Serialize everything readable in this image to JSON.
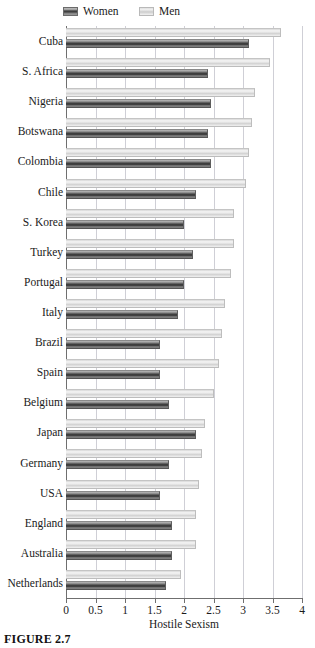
{
  "figure": {
    "caption": "FIGURE 2.7"
  },
  "legend": {
    "position": "top-left",
    "entries": [
      {
        "label": "Women",
        "swatch": "dark-striped-bar-swatch"
      },
      {
        "label": "Men",
        "swatch": "light-bar-swatch"
      }
    ]
  },
  "axis": {
    "x_title": "Hostile Sexism",
    "x_ticks": [
      "0",
      "0.5",
      "1",
      "1.5",
      "2",
      "2.5",
      "3",
      "3.5",
      "4"
    ]
  },
  "chart_data": {
    "type": "bar",
    "orientation": "horizontal",
    "title": "",
    "subtitle": "",
    "xlabel": "Hostile Sexism",
    "ylabel": "",
    "xlim": [
      0,
      4
    ],
    "xticks": [
      0,
      0.5,
      1,
      1.5,
      2,
      2.5,
      3,
      3.5,
      4
    ],
    "grid": true,
    "grid_axis": "x",
    "legend": "top-left",
    "categories": [
      "Cuba",
      "S. Africa",
      "Nigeria",
      "Botswana",
      "Colombia",
      "Chile",
      "S. Korea",
      "Turkey",
      "Portugal",
      "Italy",
      "Brazil",
      "Spain",
      "Belgium",
      "Japan",
      "Germany",
      "USA",
      "England",
      "Australia",
      "Netherlands"
    ],
    "series": [
      {
        "name": "Men",
        "color": "#e6e6e6",
        "values": [
          3.65,
          3.45,
          3.2,
          3.15,
          3.1,
          3.05,
          2.85,
          2.85,
          2.8,
          2.7,
          2.65,
          2.6,
          2.5,
          2.35,
          2.3,
          2.25,
          2.2,
          2.2,
          1.95
        ]
      },
      {
        "name": "Women",
        "color": "#454545",
        "values": [
          3.1,
          2.4,
          2.45,
          2.4,
          2.45,
          2.2,
          2.0,
          2.15,
          2.0,
          1.9,
          1.6,
          1.6,
          1.75,
          2.2,
          1.75,
          1.6,
          1.8,
          1.8,
          1.7
        ]
      }
    ]
  }
}
